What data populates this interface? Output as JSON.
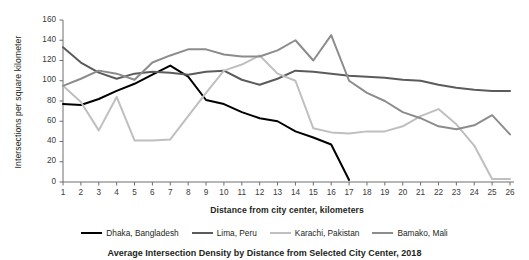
{
  "chart_data": {
    "type": "line",
    "title": "",
    "xlabel": "Distance from city center, kilometers",
    "ylabel": "Intersections per square kilometer",
    "xlim": [
      1,
      26
    ],
    "ylim": [
      0,
      160
    ],
    "ytick_labels": [
      "0",
      "20",
      "40",
      "60",
      "80",
      "100",
      "120",
      "140",
      "160"
    ],
    "ytick_values": [
      0,
      20,
      40,
      60,
      80,
      100,
      120,
      140,
      160
    ],
    "xtick_labels": [
      "1",
      "2",
      "3",
      "4",
      "5",
      "6",
      "7",
      "8",
      "9",
      "10",
      "11",
      "12",
      "13",
      "14",
      "15",
      "16",
      "17",
      "18",
      "19",
      "20",
      "21",
      "22",
      "23",
      "24",
      "25",
      "26"
    ],
    "x": [
      1,
      2,
      3,
      4,
      5,
      6,
      7,
      8,
      9,
      10,
      11,
      12,
      13,
      14,
      15,
      16,
      17,
      18,
      19,
      20,
      21,
      22,
      23,
      24,
      25,
      26
    ],
    "grid": false,
    "legend_position": "bottom",
    "series": [
      {
        "name": "Dhaka, Bangladesh",
        "color": "#000000",
        "values": [
          77,
          76,
          82,
          90,
          97,
          106,
          115,
          104,
          81,
          77,
          69,
          63,
          60,
          50,
          44,
          37,
          2,
          null,
          null,
          null,
          null,
          null,
          null,
          null,
          null,
          null
        ]
      },
      {
        "name": "Lima, Peru",
        "color": "#5b5b5b",
        "values": [
          133,
          118,
          108,
          102,
          107,
          109,
          108,
          106,
          109,
          110,
          101,
          96,
          102,
          110,
          109,
          107,
          105,
          104,
          103,
          101,
          100,
          96,
          93,
          91,
          90,
          90
        ]
      },
      {
        "name": "Karachi, Pakistan",
        "color": "#bfbfbf",
        "values": [
          95,
          79,
          51,
          84,
          41,
          41,
          42,
          65,
          88,
          110,
          116,
          125,
          107,
          100,
          53,
          49,
          48,
          50,
          50,
          55,
          65,
          72,
          57,
          36,
          3,
          3
        ]
      },
      {
        "name": "Bamako, Mali",
        "color": "#8c8c8c",
        "values": [
          95,
          102,
          110,
          107,
          101,
          118,
          125,
          131,
          131,
          126,
          124,
          124,
          130,
          140,
          120,
          145,
          100,
          88,
          80,
          69,
          63,
          55,
          52,
          56,
          66,
          47
        ]
      }
    ]
  },
  "caption": "Average Intersection Density by Distance from Selected City Center, 2018"
}
